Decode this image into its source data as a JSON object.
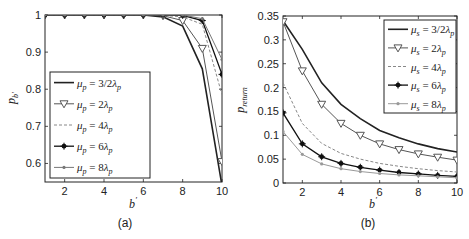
{
  "chart_data": [
    {
      "type": "line",
      "caption": "(a)",
      "title": "",
      "xlabel": "b'",
      "ylabel": "p_b'",
      "xlim": [
        1,
        10
      ],
      "ylim": [
        0.55,
        1
      ],
      "xticks": [
        2,
        4,
        6,
        8,
        10
      ],
      "yticks": [
        0.6,
        0.7,
        0.8,
        0.9,
        1
      ],
      "grid": false,
      "legend_position": "center-left",
      "x": [
        1,
        2,
        3,
        4,
        5,
        6,
        7,
        8,
        9,
        10
      ],
      "series": [
        {
          "name": "μp=3/2λp",
          "color": "#222222",
          "marker": "none",
          "dash": "solid",
          "width": 1.6,
          "values": [
            1,
            1,
            1,
            1,
            1,
            1,
            0.995,
            0.97,
            0.855,
            0.54
          ]
        },
        {
          "name": "μp=2λp",
          "color": "#555555",
          "marker": "triangle-down",
          "dash": "solid",
          "width": 1,
          "values": [
            1,
            1,
            1,
            1,
            1,
            1,
            0.998,
            0.985,
            0.91,
            0.605
          ]
        },
        {
          "name": "μp=4λp",
          "color": "#888888",
          "marker": "none",
          "dash": "dashed",
          "width": 1,
          "values": [
            1,
            1,
            1,
            1,
            1,
            1,
            0.999,
            0.995,
            0.975,
            0.785
          ]
        },
        {
          "name": "μp=6λp",
          "color": "#111111",
          "marker": "star",
          "dash": "solid",
          "width": 1.3,
          "values": [
            1,
            1,
            1,
            1,
            1,
            1,
            1,
            0.999,
            0.985,
            0.84
          ]
        },
        {
          "name": "μp=8λp",
          "color": "#777777",
          "marker": "dot",
          "dash": "solid",
          "width": 1,
          "values": [
            1,
            1,
            1,
            1,
            1,
            1,
            1,
            1,
            0.99,
            0.88
          ]
        }
      ]
    },
    {
      "type": "line",
      "caption": "(b)",
      "title": "",
      "xlabel": "b'",
      "ylabel": "p_return",
      "xlim": [
        1,
        10
      ],
      "ylim": [
        0,
        0.35
      ],
      "xticks": [
        2,
        4,
        6,
        8,
        10
      ],
      "yticks": [
        0,
        0.05,
        0.1,
        0.15,
        0.2,
        0.25,
        0.3,
        0.35
      ],
      "grid": false,
      "legend_position": "top-right",
      "x": [
        1,
        2,
        3,
        4,
        5,
        6,
        7,
        8,
        9,
        10
      ],
      "series": [
        {
          "name": "μs=3/2λp",
          "color": "#222222",
          "marker": "none",
          "dash": "solid",
          "width": 1.6,
          "values": [
            0.34,
            0.28,
            0.21,
            0.165,
            0.135,
            0.11,
            0.095,
            0.082,
            0.072,
            0.065
          ]
        },
        {
          "name": "μs=2λp",
          "color": "#555555",
          "marker": "triangle-down",
          "dash": "solid",
          "width": 1,
          "values": [
            0.338,
            0.235,
            0.165,
            0.125,
            0.1,
            0.082,
            0.07,
            0.061,
            0.054,
            0.048
          ]
        },
        {
          "name": "μs=4λp",
          "color": "#888888",
          "marker": "none",
          "dash": "dashed",
          "width": 1,
          "values": [
            0.21,
            0.125,
            0.083,
            0.062,
            0.05,
            0.041,
            0.035,
            0.03,
            0.026,
            0.023
          ]
        },
        {
          "name": "μs=6λp",
          "color": "#111111",
          "marker": "star",
          "dash": "solid",
          "width": 1.3,
          "values": [
            0.147,
            0.082,
            0.055,
            0.041,
            0.033,
            0.027,
            0.022,
            0.019,
            0.016,
            0.014
          ]
        },
        {
          "name": "μs=8λp",
          "color": "#999999",
          "marker": "dot",
          "dash": "solid",
          "width": 1,
          "values": [
            0.108,
            0.06,
            0.04,
            0.03,
            0.024,
            0.02,
            0.017,
            0.015,
            0.013,
            0.011
          ]
        }
      ]
    }
  ],
  "panels": [
    {
      "caption": "(a)",
      "xlabel_main": "b",
      "xlabel_sup": "′",
      "ylabel_main": "p",
      "ylabel_sub": "b′",
      "legend": [
        {
          "sym": "μ",
          "sub": "p",
          "eq": " = 3/2",
          "lam": "λ",
          "lamsub": "p"
        },
        {
          "sym": "μ",
          "sub": "p",
          "eq": " = 2",
          "lam": "λ",
          "lamsub": "p"
        },
        {
          "sym": "μ",
          "sub": "p",
          "eq": " = 4",
          "lam": "λ",
          "lamsub": "p"
        },
        {
          "sym": "μ",
          "sub": "p",
          "eq": " = 6",
          "lam": "λ",
          "lamsub": "p"
        },
        {
          "sym": "μ",
          "sub": "p",
          "eq": " = 8",
          "lam": "λ",
          "lamsub": "p"
        }
      ]
    },
    {
      "caption": "(b)",
      "xlabel_main": "b",
      "xlabel_sup": "′",
      "ylabel_main": "p",
      "ylabel_sub": "return",
      "legend": [
        {
          "sym": "μ",
          "sub": "s",
          "eq": " = 3/2",
          "lam": "λ",
          "lamsub": "p"
        },
        {
          "sym": "μ",
          "sub": "s",
          "eq": " = 2",
          "lam": "λ",
          "lamsub": "p"
        },
        {
          "sym": "μ",
          "sub": "s",
          "eq": " = 4",
          "lam": "λ",
          "lamsub": "p"
        },
        {
          "sym": "μ",
          "sub": "s",
          "eq": " = 6",
          "lam": "λ",
          "lamsub": "p"
        },
        {
          "sym": "μ",
          "sub": "s",
          "eq": " = 8",
          "lam": "λ",
          "lamsub": "p"
        }
      ]
    }
  ]
}
